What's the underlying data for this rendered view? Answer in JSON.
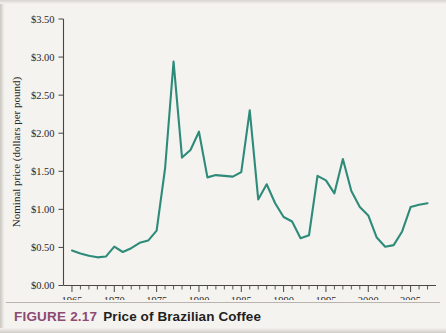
{
  "figure": {
    "label": "FIGURE 2.17",
    "title": "Price of Brazilian Coffee",
    "label_color": "#8d4a73",
    "title_color": "#231f20"
  },
  "chart_data": {
    "type": "line",
    "title": "Price of Brazilian Coffee",
    "xlabel": "",
    "ylabel": "Nominal price (dollars per pound)",
    "xlim": [
      1964,
      2008
    ],
    "ylim": [
      0.0,
      3.5
    ],
    "xtick_interval": 1,
    "xtick_label_interval": 5,
    "ytick_interval": 0.5,
    "grid": false,
    "legend": null,
    "line_color": "#2e8b7a",
    "x_tick_labels": [
      "1965",
      "1970",
      "1975",
      "1980",
      "1985",
      "1990",
      "1995",
      "2000",
      "2005"
    ],
    "x_tick_values": [
      1965,
      1970,
      1975,
      1980,
      1985,
      1990,
      1995,
      2000,
      2005
    ],
    "y_tick_labels": [
      "$0.00",
      "$0.50",
      "$1.00",
      "$1.50",
      "$2.00",
      "$2.50",
      "$3.00",
      "$3.50"
    ],
    "y_tick_values": [
      0.0,
      0.5,
      1.0,
      1.5,
      2.0,
      2.5,
      3.0,
      3.5
    ],
    "series": [
      {
        "name": "Nominal price of Brazilian coffee",
        "x": [
          1965,
          1966,
          1967,
          1968,
          1969,
          1970,
          1971,
          1972,
          1973,
          1974,
          1975,
          1976,
          1977,
          1978,
          1979,
          1980,
          1981,
          1982,
          1983,
          1984,
          1985,
          1986,
          1987,
          1988,
          1989,
          1990,
          1991,
          1992,
          1993,
          1994,
          1995,
          1996,
          1997,
          1998,
          1999,
          2000,
          2001,
          2002,
          2003,
          2004,
          2005,
          2006,
          2007
        ],
        "values": [
          0.46,
          0.42,
          0.39,
          0.37,
          0.38,
          0.51,
          0.44,
          0.49,
          0.56,
          0.59,
          0.72,
          1.54,
          2.94,
          1.68,
          1.78,
          2.02,
          1.42,
          1.45,
          1.44,
          1.43,
          1.49,
          2.3,
          1.13,
          1.33,
          1.08,
          0.9,
          0.84,
          0.62,
          0.66,
          1.44,
          1.38,
          1.21,
          1.66,
          1.24,
          1.03,
          0.92,
          0.63,
          0.51,
          0.53,
          0.71,
          1.03,
          1.06,
          1.08
        ]
      }
    ]
  },
  "axis": {
    "y_title": "Nominal price (dollars per pound)"
  }
}
